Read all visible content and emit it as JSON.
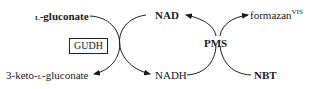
{
  "diagram": {
    "type": "coupled enzymatic reaction scheme",
    "left_cycle": {
      "substrate_prefix": "l",
      "substrate": "-gluconate",
      "product_prefix": "3-keto-",
      "product_l": "l",
      "product_suffix": "-gluconate",
      "enzyme": "GUDH"
    },
    "cofactor": {
      "oxidized": "NAD",
      "reduced": "NADH"
    },
    "right_cycle": {
      "mediator": "PMS",
      "dye_in": "NBT",
      "dye_out": "formazan",
      "dye_out_superscript": "VIS"
    }
  }
}
